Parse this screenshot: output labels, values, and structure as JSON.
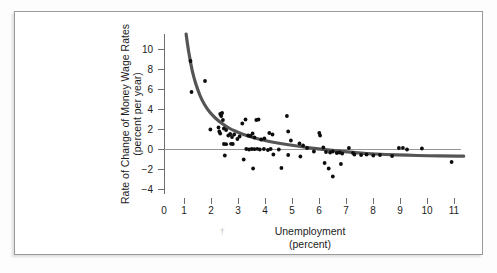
{
  "figure": {
    "frame_color": "#9a9a9a",
    "background": "#ffffff"
  },
  "chart_data": {
    "type": "scatter",
    "title": "",
    "xlabel": "Unemployment",
    "xlabel_units": "(percent)",
    "ylabel": "Rate of Change of Money Wage Rates",
    "ylabel_units": "(percent per year)",
    "xlim": [
      0,
      11.6
    ],
    "ylim": [
      -5,
      12
    ],
    "xticks": [
      0,
      1,
      2,
      3,
      4,
      5,
      6,
      7,
      8,
      9,
      10,
      11
    ],
    "xtick_labels": [
      "0",
      "1",
      "2",
      "3",
      "4",
      "5",
      "6",
      "7",
      "8",
      "9",
      "10",
      "11"
    ],
    "yticks": [
      -4,
      -2,
      0,
      2,
      4,
      6,
      8,
      10
    ],
    "ytick_labels": [
      "−4",
      "−2",
      "0",
      "2",
      "4",
      "6",
      "8",
      "10"
    ],
    "grid": false,
    "legend": null,
    "zero_line": 0,
    "point_color": "#0d0d0d",
    "curve_color": "#555555",
    "series": [
      {
        "name": "observations",
        "points": [
          [
            0.98,
            8.8
          ],
          [
            1.02,
            5.7
          ],
          [
            1.52,
            6.8
          ],
          [
            2.08,
            3.5
          ],
          [
            2.12,
            3.3
          ],
          [
            2.15,
            3.6
          ],
          [
            2.18,
            2.9
          ],
          [
            1.72,
            1.95
          ],
          [
            2.02,
            2.15
          ],
          [
            2.05,
            1.75
          ],
          [
            2.08,
            1.55
          ],
          [
            2.22,
            2.05
          ],
          [
            2.3,
            1.9
          ],
          [
            2.38,
            1.35
          ],
          [
            2.45,
            1.5
          ],
          [
            2.52,
            1.2
          ],
          [
            2.6,
            1.45
          ],
          [
            2.72,
            1.0
          ],
          [
            2.8,
            1.25
          ],
          [
            2.9,
            2.55
          ],
          [
            3.02,
            2.95
          ],
          [
            3.12,
            1.35
          ],
          [
            3.2,
            1.3
          ],
          [
            3.28,
            1.55
          ],
          [
            3.35,
            1.15
          ],
          [
            3.42,
            2.9
          ],
          [
            3.5,
            2.95
          ],
          [
            3.6,
            0.95
          ],
          [
            3.72,
            1.05
          ],
          [
            3.9,
            1.6
          ],
          [
            4.02,
            1.45
          ],
          [
            4.55,
            3.3
          ],
          [
            4.6,
            1.75
          ],
          [
            4.7,
            0.85
          ],
          [
            5.02,
            0.55
          ],
          [
            5.15,
            0.35
          ],
          [
            5.3,
            0.1
          ],
          [
            5.75,
            1.6
          ],
          [
            5.78,
            1.35
          ],
          [
            5.9,
            0.15
          ],
          [
            2.22,
            0.5
          ],
          [
            2.3,
            0.48
          ],
          [
            2.48,
            0.52
          ],
          [
            2.55,
            0.5
          ],
          [
            3.05,
            0.0
          ],
          [
            3.15,
            -0.05
          ],
          [
            3.25,
            0.0
          ],
          [
            3.35,
            -0.02
          ],
          [
            3.45,
            0.02
          ],
          [
            3.55,
            -0.05
          ],
          [
            3.7,
            0.0
          ],
          [
            3.85,
            -0.1
          ],
          [
            3.95,
            0.0
          ],
          [
            4.05,
            -0.55
          ],
          [
            4.25,
            -0.05
          ],
          [
            4.6,
            -0.6
          ],
          [
            5.05,
            -0.75
          ],
          [
            5.55,
            -0.25
          ],
          [
            6.0,
            -0.3
          ],
          [
            6.15,
            -0.35
          ],
          [
            6.25,
            -0.25
          ],
          [
            6.4,
            -0.4
          ],
          [
            6.5,
            -0.35
          ],
          [
            6.6,
            -0.45
          ],
          [
            6.85,
            0.1
          ],
          [
            7.0,
            -0.4
          ],
          [
            7.05,
            -0.55
          ],
          [
            7.3,
            -0.6
          ],
          [
            7.5,
            -0.55
          ],
          [
            7.75,
            -0.65
          ],
          [
            8.0,
            -0.6
          ],
          [
            8.45,
            -0.7
          ],
          [
            8.7,
            0.1
          ],
          [
            8.85,
            0.12
          ],
          [
            9.0,
            -0.05
          ],
          [
            9.55,
            0.05
          ],
          [
            2.25,
            -0.65
          ],
          [
            2.95,
            -1.05
          ],
          [
            3.3,
            -1.95
          ],
          [
            4.35,
            -1.9
          ],
          [
            5.95,
            -1.4
          ],
          [
            6.1,
            -1.95
          ],
          [
            6.25,
            -2.75
          ],
          [
            6.55,
            -1.5
          ],
          [
            10.65,
            -1.3
          ]
        ]
      }
    ],
    "fit_curve": {
      "name": "phillips-curve",
      "description": "fitted hyperbolic Phillips curve",
      "points": [
        [
          0.82,
          11.5
        ],
        [
          0.9,
          9.9
        ],
        [
          1.0,
          8.4
        ],
        [
          1.1,
          7.2
        ],
        [
          1.25,
          5.9
        ],
        [
          1.4,
          4.9
        ],
        [
          1.6,
          4.0
        ],
        [
          1.8,
          3.35
        ],
        [
          2.0,
          2.85
        ],
        [
          2.25,
          2.35
        ],
        [
          2.5,
          1.95
        ],
        [
          2.8,
          1.6
        ],
        [
          3.1,
          1.3
        ],
        [
          3.5,
          1.0
        ],
        [
          3.9,
          0.75
        ],
        [
          4.3,
          0.55
        ],
        [
          4.8,
          0.35
        ],
        [
          5.3,
          0.15
        ],
        [
          5.8,
          0.0
        ],
        [
          6.3,
          -0.15
        ],
        [
          6.9,
          -0.3
        ],
        [
          7.5,
          -0.45
        ],
        [
          8.2,
          -0.55
        ],
        [
          9.0,
          -0.62
        ],
        [
          9.8,
          -0.68
        ],
        [
          10.6,
          -0.7
        ],
        [
          11.1,
          -0.72
        ]
      ]
    }
  }
}
